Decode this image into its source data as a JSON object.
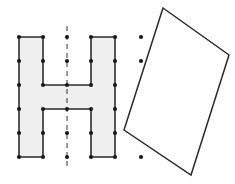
{
  "diagram": {
    "colors": {
      "background": "#ffffff",
      "shape_fill": "#efefef",
      "stroke": "#2b2b2b",
      "dot": "#1a1a1a",
      "dash_line": "#333333"
    },
    "grid": {
      "columns_x": [
        19,
        43,
        67,
        91,
        115,
        139
      ],
      "rows_y": [
        37,
        61,
        85,
        109,
        133,
        157
      ],
      "spacing": 24
    },
    "h_shape": {
      "points": [
        [
          19,
          37
        ],
        [
          43,
          37
        ],
        [
          43,
          85
        ],
        [
          91,
          85
        ],
        [
          91,
          37
        ],
        [
          115,
          37
        ],
        [
          115,
          157
        ],
        [
          91,
          157
        ],
        [
          91,
          109
        ],
        [
          43,
          109
        ],
        [
          43,
          157
        ],
        [
          19,
          157
        ]
      ]
    },
    "symmetry_line": {
      "x": 67,
      "y1": 26,
      "y2": 168,
      "dash": "5,4"
    },
    "dots": [
      [
        19,
        37
      ],
      [
        19,
        61
      ],
      [
        19,
        85
      ],
      [
        19,
        109
      ],
      [
        19,
        133
      ],
      [
        19,
        157
      ],
      [
        43,
        37
      ],
      [
        43,
        61
      ],
      [
        43,
        85
      ],
      [
        43,
        109
      ],
      [
        43,
        133
      ],
      [
        43,
        157
      ],
      [
        67,
        37
      ],
      [
        67,
        61
      ],
      [
        67,
        85
      ],
      [
        67,
        109
      ],
      [
        67,
        133
      ],
      [
        67,
        157
      ],
      [
        91,
        37
      ],
      [
        91,
        61
      ],
      [
        91,
        85
      ],
      [
        91,
        109
      ],
      [
        91,
        133
      ],
      [
        91,
        157
      ],
      [
        115,
        37
      ],
      [
        115,
        61
      ],
      [
        115,
        85
      ],
      [
        115,
        109
      ],
      [
        115,
        133
      ],
      [
        115,
        157
      ],
      [
        141,
        37
      ],
      [
        141,
        61
      ],
      [
        141,
        157
      ]
    ],
    "quadrilateral": {
      "points": [
        [
          163,
          8
        ],
        [
          229,
          55
        ],
        [
          191,
          175
        ],
        [
          124,
          130
        ]
      ]
    }
  }
}
